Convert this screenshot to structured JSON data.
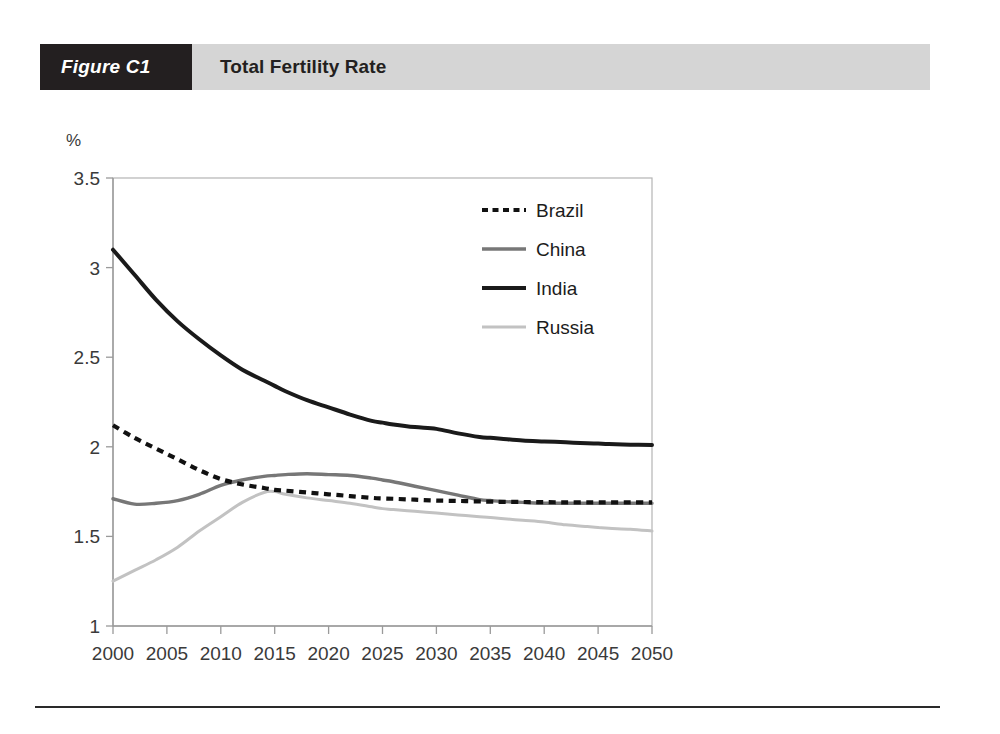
{
  "figure": {
    "tag": "Figure C1",
    "title": "Total Fertility Rate"
  },
  "colors": {
    "banner_tag_bg": "#231f20",
    "banner_bg": "#d5d5d5",
    "brazil": "#111111",
    "china": "#777777",
    "india": "#1a1a1a",
    "russia": "#c2c2c2",
    "axis": "#9a9a9a",
    "text": "#3a3a3a",
    "footer_rule": "#2a2a2a"
  },
  "chart_data": {
    "type": "line",
    "title": "Total Fertility Rate",
    "xlabel": "",
    "ylabel": "%",
    "yunit": "%",
    "xlim": [
      2000,
      2050
    ],
    "ylim": [
      1,
      3.5
    ],
    "xticks": [
      2000,
      2005,
      2010,
      2015,
      2020,
      2025,
      2030,
      2035,
      2040,
      2045,
      2050
    ],
    "xtick_labels": [
      "2000",
      "2005",
      "2010",
      "2015",
      "2020",
      "2025",
      "2030",
      "2035",
      "2040",
      "2045",
      "2050"
    ],
    "yticks": [
      1,
      1.5,
      2,
      2.5,
      3,
      3.5
    ],
    "ytick_labels": [
      "1",
      "1.5",
      "2",
      "2.5",
      "3",
      "3.5"
    ],
    "grid": false,
    "legend_position": "top-center",
    "x": [
      2000,
      2002,
      2004,
      2006,
      2008,
      2010,
      2012,
      2014,
      2015,
      2016,
      2018,
      2020,
      2022,
      2024,
      2025,
      2026,
      2028,
      2030,
      2032,
      2034,
      2035,
      2036,
      2038,
      2040,
      2042,
      2044,
      2045,
      2046,
      2048,
      2050
    ],
    "series": [
      {
        "name": "Brazil",
        "style": "dotted",
        "color": "#111111",
        "values": [
          2.12,
          2.05,
          1.99,
          1.93,
          1.87,
          1.82,
          1.79,
          1.77,
          1.76,
          1.755,
          1.745,
          1.735,
          1.725,
          1.715,
          1.712,
          1.71,
          1.705,
          1.7,
          1.698,
          1.695,
          1.694,
          1.693,
          1.692,
          1.691,
          1.69,
          1.69,
          1.69,
          1.69,
          1.69,
          1.69
        ]
      },
      {
        "name": "China",
        "style": "solid",
        "color": "#777777",
        "values": [
          1.71,
          1.68,
          1.685,
          1.7,
          1.735,
          1.785,
          1.815,
          1.835,
          1.84,
          1.845,
          1.85,
          1.845,
          1.84,
          1.825,
          1.815,
          1.805,
          1.78,
          1.755,
          1.73,
          1.705,
          1.7,
          1.695,
          1.69,
          1.685,
          1.685,
          1.685,
          1.685,
          1.685,
          1.685,
          1.685
        ]
      },
      {
        "name": "India",
        "style": "solid-thick",
        "color": "#1a1a1a",
        "values": [
          3.1,
          2.96,
          2.82,
          2.7,
          2.6,
          2.51,
          2.43,
          2.37,
          2.34,
          2.31,
          2.26,
          2.22,
          2.18,
          2.145,
          2.135,
          2.125,
          2.11,
          2.1,
          2.075,
          2.055,
          2.05,
          2.045,
          2.035,
          2.03,
          2.025,
          2.02,
          2.018,
          2.015,
          2.012,
          2.01
        ]
      },
      {
        "name": "Russia",
        "style": "solid-light",
        "color": "#c2c2c2",
        "values": [
          1.25,
          1.31,
          1.37,
          1.44,
          1.53,
          1.61,
          1.69,
          1.745,
          1.75,
          1.735,
          1.715,
          1.7,
          1.685,
          1.665,
          1.655,
          1.65,
          1.64,
          1.63,
          1.62,
          1.61,
          1.605,
          1.6,
          1.59,
          1.58,
          1.565,
          1.555,
          1.55,
          1.545,
          1.54,
          1.53
        ]
      }
    ]
  },
  "legend": {
    "items": [
      {
        "label": "Brazil"
      },
      {
        "label": "China"
      },
      {
        "label": "India"
      },
      {
        "label": "Russia"
      }
    ]
  }
}
